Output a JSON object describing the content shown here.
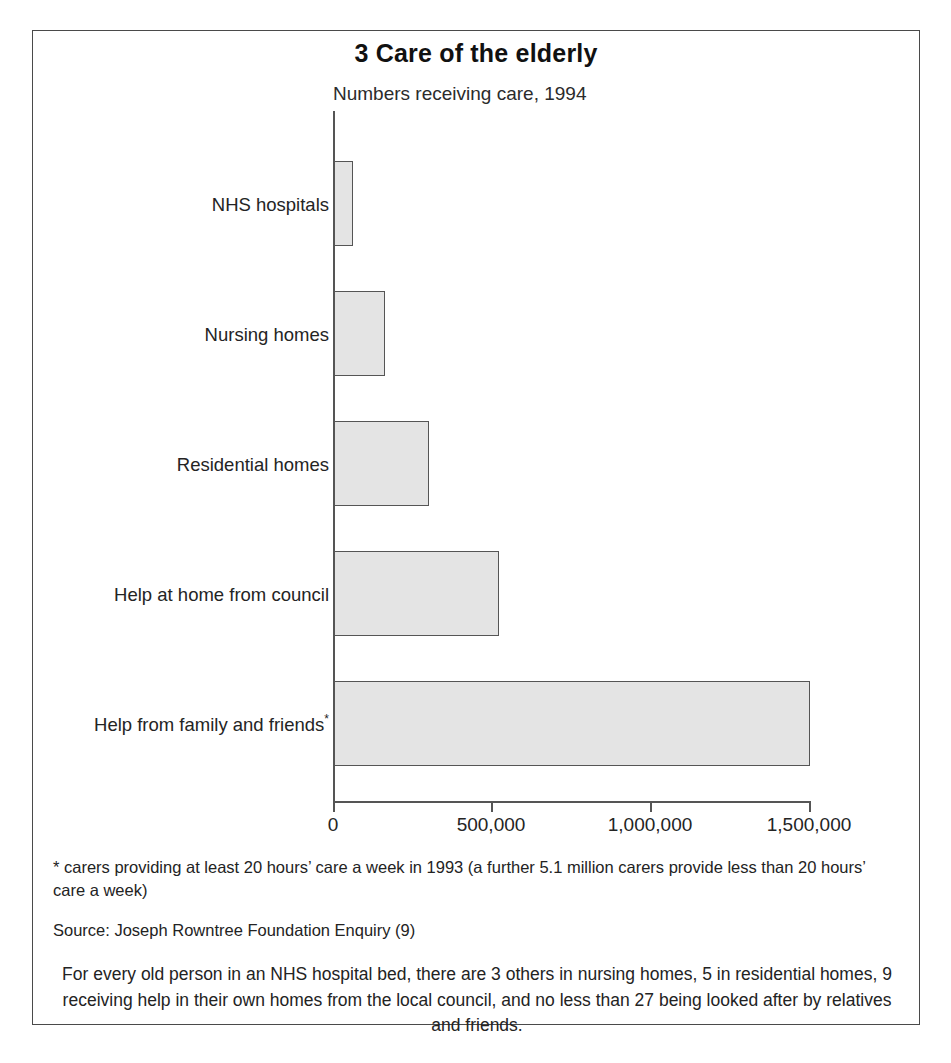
{
  "chart_data": {
    "type": "bar",
    "orientation": "horizontal",
    "title": "3 Care of the elderly",
    "subtitle": "Numbers receiving care, 1994",
    "xlabel": "",
    "ylabel": "",
    "xlim": [
      0,
      1500000
    ],
    "grid": false,
    "legend": null,
    "categories": [
      "NHS hospitals",
      "Nursing homes",
      "Residential homes",
      "Help at home from council",
      "Help from family and friends*"
    ],
    "values": [
      60000,
      160000,
      300000,
      520000,
      1500000
    ],
    "tick_labels": [
      "0",
      "500,000",
      "1,000,000",
      "1,500,000"
    ],
    "tick_values": [
      0,
      500000,
      1000000,
      1500000
    ],
    "bar_fill_color": "#e4e4e4",
    "bar_border_color": "#555555",
    "annotations": [
      "* carers providing at least 20 hours’ care a week in 1993 (a further 5.1 million carers provide less than 20 hours’ care a week)",
      "Source: Joseph Rowntree Foundation Enquiry (9)"
    ]
  },
  "figure": {
    "title": "3 Care of the elderly",
    "subtitle": "Numbers receiving care, 1994",
    "bars": [
      {
        "label": "NHS hospitals",
        "label_mark": "",
        "value": 60000
      },
      {
        "label": "Nursing homes",
        "label_mark": "",
        "value": 160000
      },
      {
        "label": "Residential homes",
        "label_mark": "",
        "value": 300000
      },
      {
        "label": "Help at home from council",
        "label_mark": "",
        "value": 520000
      },
      {
        "label": "Help from family and friends",
        "label_mark": "*",
        "value": 1500000
      }
    ],
    "axis": {
      "ticks": [
        {
          "label": "0",
          "value": 0
        },
        {
          "label": "500,000",
          "value": 500000
        },
        {
          "label": "1,000,000",
          "value": 1000000
        },
        {
          "label": "1,500,000",
          "value": 1500000
        }
      ]
    },
    "footnote": "* carers providing at least 20 hours’ care a week in 1993 (a further 5.1 million carers provide less than 20 hours’ care a week)",
    "source": "Source: Joseph Rowntree Foundation Enquiry (9)",
    "summary": "For every old person in an NHS hospital bed, there are 3 others in nursing homes, 5 in residential homes, 9 receiving help in their own homes from the local council, and no less than 27 being looked after by relatives and friends."
  }
}
